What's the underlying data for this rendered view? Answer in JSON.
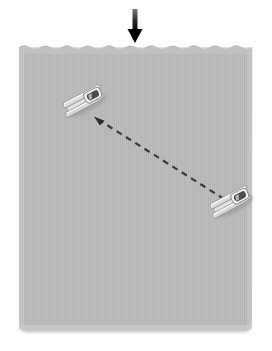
{
  "canvas": {
    "width": 272,
    "height": 351,
    "background_color": "#ffffff"
  },
  "water": {
    "label": "water-surface",
    "fill_color": "#bdbdbd",
    "stripe_color": "#b4b4b4",
    "shadow_color": "#c9c9c9",
    "left": 19,
    "right": 252,
    "top": 44,
    "bottom": 331,
    "wave_amplitude": 3,
    "wave_count": 22
  },
  "arrow": {
    "label": "downward-arrow",
    "color": "#000000",
    "shaft_x": 135,
    "shaft_top": 9,
    "shaft_bottom": 32,
    "shaft_width": 5,
    "head_width": 15,
    "head_tip_y": 43,
    "gradient_top_color": "#6f6f6f",
    "gradient_bottom_color": "#000000"
  },
  "trajectory": {
    "label": "dashed-trajectory-line",
    "color": "#3a3a40",
    "stroke_width": 2.2,
    "dash_pattern": "6 5",
    "start_x": 96,
    "start_y": 118,
    "end_x": 224,
    "end_y": 199,
    "arrowhead_at": "start",
    "arrowhead_size": 7
  },
  "boats": [
    {
      "name": "upper-left-boat",
      "center_x": 84,
      "center_y": 101,
      "rotation_deg": -28,
      "scale": 1.0,
      "hull_color": "#f4f4f4",
      "hull_shade_color": "#d2d2d2",
      "outline_color": "#7d7d7d",
      "cockpit_color": "#4a4a4a"
    },
    {
      "name": "lower-right-boat",
      "center_x": 231,
      "center_y": 202,
      "rotation_deg": -28,
      "scale": 1.0,
      "hull_color": "#f4f4f4",
      "hull_shade_color": "#d2d2d2",
      "outline_color": "#7d7d7d",
      "cockpit_color": "#4a4a4a"
    }
  ]
}
